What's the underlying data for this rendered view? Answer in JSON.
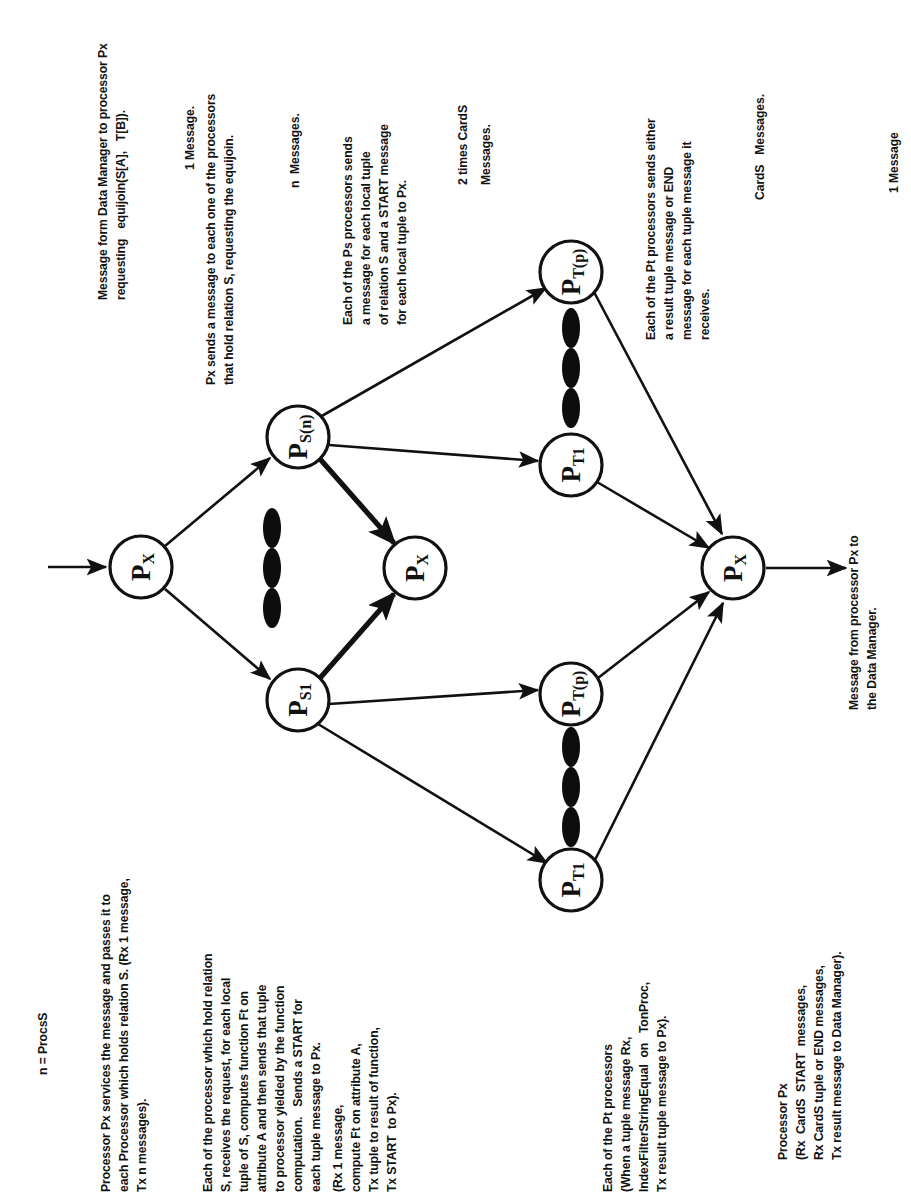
{
  "figure": {
    "type": "message-flow-diagram",
    "legend_note": "n = ProcsS"
  },
  "annotations": {
    "top": [
      {
        "id": "msg-from-dm",
        "lines": [
          "Message form Data Manager to processor Px",
          "requesting   equijoin(S[A],   T[B])."
        ],
        "count_label": "1 Message."
      },
      {
        "id": "px-sends",
        "lines": [
          "Px sends a message to each one of the processors",
          "that hold relation S, requesting the equijoin."
        ],
        "count_label": "n  Messages."
      },
      {
        "id": "ps-sends",
        "lines": [
          "Each of the Ps processors sends",
          "a message for each local tuple",
          "of relation S and a START message",
          "for each local tuple to Px."
        ],
        "count_label": "2 times CardS",
        "count_label2": "Messages."
      },
      {
        "id": "pt-sends",
        "lines": [
          "Each of the Pt processors sends either",
          "a result tuple message or END",
          "message for each tuple message it",
          "receives."
        ],
        "count_label": "CardS   Messages."
      },
      {
        "id": "msg-to-dm",
        "count_label": "1 Message"
      }
    ],
    "bottom": [
      {
        "id": "legend",
        "lines": [
          "n = ProcsS"
        ]
      },
      {
        "id": "px-services",
        "lines": [
          "Processor Px services the message and passes it to",
          "each Processor which holds relation S. (Rx 1 message,",
          "Tx n messages)."
        ]
      },
      {
        "id": "ps-detail",
        "lines": [
          "Each of the processor which hold relation",
          "S, receives the request, for each local",
          "tuple of S, computes function Ft on",
          "attribute A and then sends that tuple",
          "to processor yielded by the function",
          "computation.   Sends a START for",
          "each tuple message to Px.",
          "(Rx 1 message,",
          "compute Ft on attribute A,",
          "Tx tuple to result of function,",
          "Tx START  to Px)."
        ]
      },
      {
        "id": "pt-detail",
        "lines": [
          "Each of the Pt processors",
          "(When a tuple message Rx,",
          "IndexFilterStringEqual  on   TonProc,",
          "Tx result tuple message to Px)."
        ]
      },
      {
        "id": "px-collect",
        "lines": [
          "Processor Px",
          "(Rx  CardS  START  messages,",
          "Rx CardS tuple or END messages,",
          "Tx result message to Data Manager)."
        ]
      }
    ],
    "edge_labels": {
      "to_data_manager": [
        "Message from processor Px to",
        "the Data Manager."
      ]
    }
  },
  "nodes": [
    {
      "id": "px-in",
      "main": "P",
      "sub": "X",
      "cx": 141,
      "cy": 567,
      "r": 31
    },
    {
      "id": "ps-n",
      "main": "P",
      "sub": "S(n)",
      "cx": 298,
      "cy": 437,
      "r": 31
    },
    {
      "id": "ps-1",
      "main": "P",
      "sub": "S1",
      "cx": 298,
      "cy": 700,
      "r": 31
    },
    {
      "id": "px-mid",
      "main": "P",
      "sub": "X",
      "cx": 415,
      "cy": 568,
      "r": 31
    },
    {
      "id": "pt-p-top",
      "main": "P",
      "sub": "T(p)",
      "cx": 571,
      "cy": 272,
      "r": 31
    },
    {
      "id": "pt-1-top",
      "main": "P",
      "sub": "T1",
      "cx": 571,
      "cy": 465,
      "r": 31
    },
    {
      "id": "pt-p-bot",
      "main": "P",
      "sub": "T(p)",
      "cx": 571,
      "cy": 694,
      "r": 31
    },
    {
      "id": "pt-1-bot",
      "main": "P",
      "sub": "T1",
      "cx": 571,
      "cy": 880,
      "r": 31
    },
    {
      "id": "px-out",
      "main": "P",
      "sub": "X",
      "cx": 733,
      "cy": 568,
      "r": 31
    }
  ],
  "ellipsis_groups": [
    {
      "id": "ps-ellipsis",
      "cx": 272,
      "cy": 568
    },
    {
      "id": "pt-top-ellipsis",
      "cx": 571,
      "cy": 368
    },
    {
      "id": "pt-bot-ellipsis",
      "cx": 571,
      "cy": 787
    }
  ],
  "colors": {
    "ink": "#111111",
    "page": "#ffffff"
  }
}
